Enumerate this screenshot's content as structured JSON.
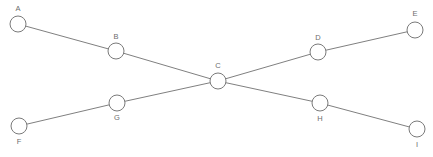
{
  "diagram": {
    "type": "node-link-diagram",
    "background_color": "#ffffff",
    "edge_color": "#808080",
    "node_stroke_color": "#7a7a7a",
    "node_fill_color": "#ffffff",
    "label_color": "#6e6e6e",
    "node_radius": 8,
    "width": 433,
    "height": 157,
    "nodes": [
      {
        "id": "A",
        "label": "A",
        "x": 18,
        "y": 24,
        "label_x": 18,
        "label_y": 9,
        "label_position": "above"
      },
      {
        "id": "B",
        "label": "B",
        "x": 116,
        "y": 51,
        "label_x": 116,
        "label_y": 37,
        "label_position": "above"
      },
      {
        "id": "C",
        "label": "C",
        "x": 218,
        "y": 81,
        "label_x": 218,
        "label_y": 66,
        "label_position": "above"
      },
      {
        "id": "D",
        "label": "D",
        "x": 318,
        "y": 52,
        "label_x": 318,
        "label_y": 38,
        "label_position": "above"
      },
      {
        "id": "E",
        "label": "E",
        "x": 415,
        "y": 30,
        "label_x": 415,
        "label_y": 14,
        "label_position": "above"
      },
      {
        "id": "F",
        "label": "F",
        "x": 19,
        "y": 126,
        "label_x": 19,
        "label_y": 142,
        "label_position": "below"
      },
      {
        "id": "G",
        "label": "G",
        "x": 117,
        "y": 103,
        "label_x": 117,
        "label_y": 118,
        "label_position": "below"
      },
      {
        "id": "H",
        "label": "H",
        "x": 320,
        "y": 103,
        "label_x": 320,
        "label_y": 119,
        "label_position": "below"
      },
      {
        "id": "I",
        "label": "I",
        "x": 417,
        "y": 129,
        "label_x": 417,
        "label_y": 145,
        "label_position": "below"
      }
    ],
    "edges": [
      {
        "id": "A-B",
        "source": "A",
        "target": "B"
      },
      {
        "id": "B-C",
        "source": "B",
        "target": "C"
      },
      {
        "id": "C-D",
        "source": "C",
        "target": "D"
      },
      {
        "id": "D-E",
        "source": "D",
        "target": "E"
      },
      {
        "id": "F-G",
        "source": "F",
        "target": "G"
      },
      {
        "id": "G-C",
        "source": "G",
        "target": "C"
      },
      {
        "id": "C-H",
        "source": "C",
        "target": "H"
      },
      {
        "id": "H-I",
        "source": "H",
        "target": "I"
      }
    ]
  }
}
